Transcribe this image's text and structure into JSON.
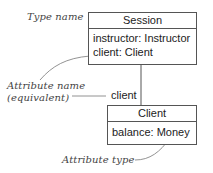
{
  "annotations": {
    "type_name": "Type name",
    "attribute_name_line1": "Attribute name",
    "attribute_name_line2": "(equivalent)",
    "attribute_type": "Attribute type"
  },
  "session": {
    "title": "Session",
    "attributes": [
      "instructor: Instructor",
      "client: Client"
    ]
  },
  "association": {
    "role_name": "client"
  },
  "client": {
    "title": "Client",
    "attributes": [
      "balance: Money"
    ]
  }
}
